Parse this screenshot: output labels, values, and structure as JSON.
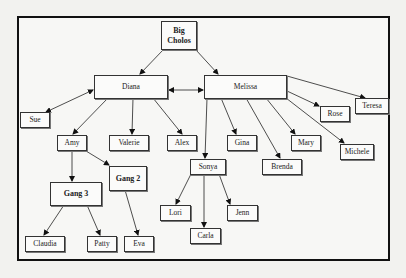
{
  "diagram": {
    "type": "org-chart",
    "nodes": {
      "big_cholos": {
        "label": "Big\nCholos",
        "bold": true
      },
      "diana": {
        "label": "Diana"
      },
      "melissa": {
        "label": "Melissa"
      },
      "sue": {
        "label": "Sue"
      },
      "amy": {
        "label": "Amy"
      },
      "valerie": {
        "label": "Valerie"
      },
      "alex": {
        "label": "Alex"
      },
      "gina": {
        "label": "Gina"
      },
      "mary": {
        "label": "Mary"
      },
      "rose": {
        "label": "Rose"
      },
      "teresa": {
        "label": "Teresa"
      },
      "michele": {
        "label": "Michele"
      },
      "brenda": {
        "label": "Brenda"
      },
      "sonya": {
        "label": "Sonya"
      },
      "gang3": {
        "label": "Gang 3",
        "bold": true
      },
      "gang2": {
        "label": "Gang 2",
        "bold": true
      },
      "lori": {
        "label": "Lori"
      },
      "jenn": {
        "label": "Jenn"
      },
      "carla": {
        "label": "Carla"
      },
      "claudia": {
        "label": "Claudia"
      },
      "patty": {
        "label": "Patty"
      },
      "eva": {
        "label": "Eva"
      }
    },
    "edges": [
      {
        "from": "Big Cholos",
        "to": "Diana",
        "type": "directed"
      },
      {
        "from": "Big Cholos",
        "to": "Melissa",
        "type": "directed"
      },
      {
        "from": "Diana",
        "to": "Melissa",
        "type": "bidirectional"
      },
      {
        "from": "Diana",
        "to": "Sue",
        "type": "bidirectional"
      },
      {
        "from": "Diana",
        "to": "Amy",
        "type": "directed"
      },
      {
        "from": "Diana",
        "to": "Valerie",
        "type": "directed"
      },
      {
        "from": "Diana",
        "to": "Alex",
        "type": "directed"
      },
      {
        "from": "Melissa",
        "to": "Sonya",
        "type": "directed"
      },
      {
        "from": "Melissa",
        "to": "Gina",
        "type": "directed"
      },
      {
        "from": "Melissa",
        "to": "Brenda",
        "type": "directed"
      },
      {
        "from": "Melissa",
        "to": "Mary",
        "type": "directed"
      },
      {
        "from": "Melissa",
        "to": "Michele",
        "type": "directed"
      },
      {
        "from": "Melissa",
        "to": "Rose",
        "type": "directed"
      },
      {
        "from": "Melissa",
        "to": "Teresa",
        "type": "directed"
      },
      {
        "from": "Amy",
        "to": "Gang 3",
        "type": "directed"
      },
      {
        "from": "Amy",
        "to": "Gang 2",
        "type": "directed"
      },
      {
        "from": "Gang 3",
        "to": "Claudia",
        "type": "directed"
      },
      {
        "from": "Gang 3",
        "to": "Patty",
        "type": "directed"
      },
      {
        "from": "Gang 2",
        "to": "Eva",
        "type": "directed"
      },
      {
        "from": "Sonya",
        "to": "Lori",
        "type": "directed"
      },
      {
        "from": "Sonya",
        "to": "Carla",
        "type": "directed"
      },
      {
        "from": "Sonya",
        "to": "Jenn",
        "type": "directed"
      }
    ]
  }
}
